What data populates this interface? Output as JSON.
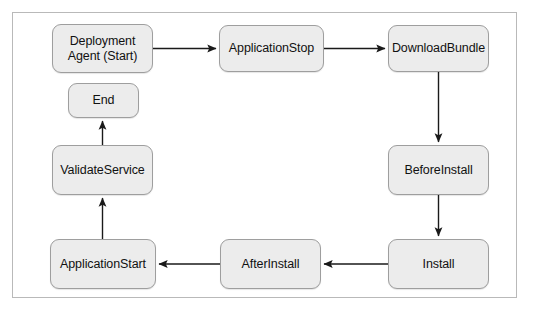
{
  "diagram": {
    "frame": {
      "border_color": "#b9b9b9",
      "background": "#ffffff"
    },
    "style": {
      "node_fill": "#ececec",
      "node_border": "#9e9e9e",
      "edge_color": "#1a1a1a",
      "text_color": "#111111"
    },
    "nodes": [
      {
        "id": "deployment-agent-start",
        "label": "Deployment\nAgent (Start)",
        "x": 52,
        "y": 24,
        "w": 101,
        "h": 49
      },
      {
        "id": "application-stop",
        "label": "ApplicationStop",
        "x": 219,
        "y": 25,
        "w": 105,
        "h": 47
      },
      {
        "id": "download-bundle",
        "label": "DownloadBundle",
        "x": 388,
        "y": 25,
        "w": 101,
        "h": 47
      },
      {
        "id": "end",
        "label": "End",
        "x": 68,
        "y": 83,
        "w": 71,
        "h": 35
      },
      {
        "id": "validate-service",
        "label": "ValidateService",
        "x": 52,
        "y": 145,
        "w": 101,
        "h": 50
      },
      {
        "id": "before-install",
        "label": "BeforeInstall",
        "x": 388,
        "y": 145,
        "w": 101,
        "h": 50
      },
      {
        "id": "application-start",
        "label": "ApplicationStart",
        "x": 50,
        "y": 239,
        "w": 106,
        "h": 50
      },
      {
        "id": "after-install",
        "label": "AfterInstall",
        "x": 220,
        "y": 239,
        "w": 101,
        "h": 50
      },
      {
        "id": "install",
        "label": "Install",
        "x": 388,
        "y": 239,
        "w": 101,
        "h": 50
      }
    ],
    "edges": [
      {
        "id": "edge-agent-to-applicationstop",
        "from": "deployment-agent-start",
        "to": "application-stop",
        "direction": "right"
      },
      {
        "id": "edge-applicationstop-to-downloadbundle",
        "from": "application-stop",
        "to": "download-bundle",
        "direction": "right"
      },
      {
        "id": "edge-downloadbundle-to-beforeinstall",
        "from": "download-bundle",
        "to": "before-install",
        "direction": "down"
      },
      {
        "id": "edge-beforeinstall-to-install",
        "from": "before-install",
        "to": "install",
        "direction": "down"
      },
      {
        "id": "edge-install-to-afterinstall",
        "from": "install",
        "to": "after-install",
        "direction": "left"
      },
      {
        "id": "edge-afterinstall-to-applicationstart",
        "from": "after-install",
        "to": "application-start",
        "direction": "left"
      },
      {
        "id": "edge-applicationstart-to-validateservice",
        "from": "application-start",
        "to": "validate-service",
        "direction": "up"
      },
      {
        "id": "edge-validateservice-to-end",
        "from": "validate-service",
        "to": "end",
        "direction": "up"
      }
    ]
  }
}
